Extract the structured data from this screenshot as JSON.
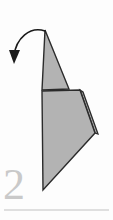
{
  "figure": {
    "kind": "origami-fold-step-diagram",
    "step_number": "2",
    "background_color": "#fdfdfd",
    "paper_fill": "#b3b3b3",
    "paper_stroke": "#2b2b2b",
    "arrow_color": "#1a1a1a",
    "step_number_color": "#c9c9c9",
    "divider_color": "#d5d5d5"
  },
  "shapes": {
    "upper_flap": {
      "name": "upper-triangle-flap",
      "points": "45,30 42,90 69,89"
    },
    "lower_body": {
      "name": "lower-quadrilateral-body",
      "points": "42,91 80,90 95,133 43,190"
    },
    "layer_edge": {
      "name": "folded-layer-edge",
      "points": "83,92 98,134 95,133 80,90"
    }
  },
  "arrow": {
    "name": "fold-direction-arrow",
    "path": "M 45,31 C 30,26 16,38 14,56",
    "head": "14,64 9,50 20,50"
  },
  "divider": {
    "name": "section-divider-rule",
    "x1": 4,
    "y1": 210,
    "x2": 109,
    "y2": 210
  }
}
